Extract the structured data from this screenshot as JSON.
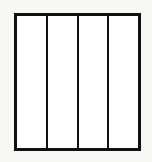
{
  "figure": {
    "name": "four-column-rectangle",
    "caption": "",
    "background_color": "#f7f7f6",
    "fill_color": "#ffffff",
    "line_color": "#111111",
    "border_width_px": 3,
    "divider_width_px": 2,
    "frame": {
      "x": 14,
      "y": 13,
      "width": 127,
      "height": 138
    },
    "column_count": 4,
    "divider_count": 3,
    "columns": [
      {
        "index": 1,
        "label": ""
      },
      {
        "index": 2,
        "label": ""
      },
      {
        "index": 3,
        "label": ""
      },
      {
        "index": 4,
        "label": ""
      }
    ]
  }
}
